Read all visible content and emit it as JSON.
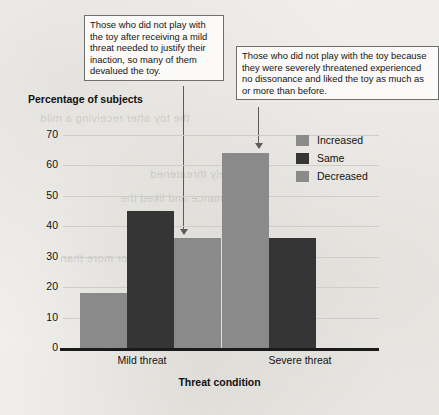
{
  "callouts": [
    {
      "id": "mild",
      "text": "Those who did not play with the toy after receiving a mild threat needed to justify their inaction, so many of them devalued the toy."
    },
    {
      "id": "severe",
      "text": "Those who did not play with the toy because they were severely threatened experienced no dissonance and liked the toy as much as or more than before."
    }
  ],
  "chart_data": {
    "type": "bar",
    "title": "",
    "xlabel": "Threat condition",
    "ylabel": "Percentage of subjects",
    "categories": [
      "Mild threat",
      "Severe threat"
    ],
    "series": [
      {
        "name": "Increased",
        "color": "#8a8a8a",
        "values": [
          18,
          64
        ]
      },
      {
        "name": "Same",
        "color": "#353535",
        "values": [
          45,
          36
        ]
      },
      {
        "name": "Decreased",
        "color": "#8a8a8a",
        "values": [
          36,
          0
        ]
      }
    ],
    "ylim": [
      0,
      70
    ],
    "yticks": [
      0,
      10,
      20,
      30,
      40,
      50,
      60,
      70
    ],
    "ytick_labels": [
      "0",
      "10",
      "20",
      "30",
      "40",
      "50",
      "60",
      "70"
    ],
    "grid": true,
    "legend_position": "top-right"
  },
  "annotations": {
    "arrow_mild_target": "Mild threat / Decreased bar top",
    "arrow_severe_target": "Severe threat / Increased bar top"
  },
  "background_ghost_text": [
    "the toy after receiving a mild",
    "severely threatened",
    "no dissonance and liked the",
    "as much as or more than"
  ]
}
